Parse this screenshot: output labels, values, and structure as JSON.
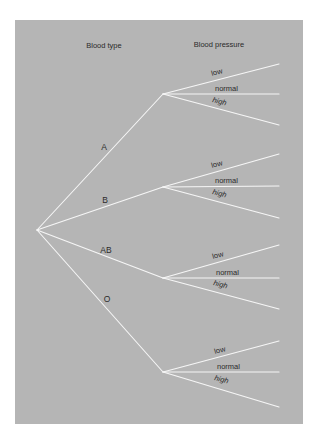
{
  "diagram": {
    "type": "tree",
    "headers": {
      "level1": "Blood type",
      "level2": "Blood pressure"
    },
    "colors": {
      "background": "#b5b5b5",
      "lines": "#f6f6f6",
      "text": "#2b2b2b"
    },
    "root": {
      "x": 37,
      "y": 230
    },
    "branches": [
      {
        "label": "A",
        "node": {
          "x": 163,
          "y": 94
        },
        "children": [
          "low",
          "normal",
          "high"
        ]
      },
      {
        "label": "B",
        "node": {
          "x": 163,
          "y": 187
        },
        "children": [
          "low",
          "normal",
          "high"
        ]
      },
      {
        "label": "AB",
        "node": {
          "x": 163,
          "y": 278
        },
        "children": [
          "low",
          "normal",
          "high"
        ]
      },
      {
        "label": "O",
        "node": {
          "x": 163,
          "y": 372
        },
        "children": [
          "low",
          "normal",
          "high"
        ]
      }
    ]
  }
}
